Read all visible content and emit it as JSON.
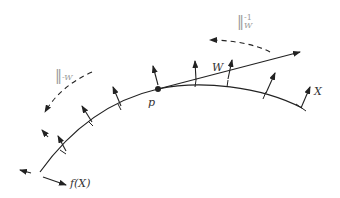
{
  "diagram": {
    "labels": {
      "point": "p",
      "vector": "W",
      "field": "X",
      "flow": "f(X)",
      "transport_left": "‖",
      "transport_left_sub": "-W",
      "transport_right": "‖",
      "transport_right_sub": "W",
      "transport_right_sup": "-1"
    },
    "colors": {
      "stroke": "#222222",
      "label": "#333333",
      "muted": "#999999"
    }
  }
}
